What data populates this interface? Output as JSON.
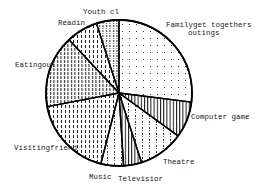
{
  "chart_data": {
    "type": "pie",
    "title": "",
    "start_angle_deg": 0,
    "direction": "clockwise",
    "slices": [
      {
        "label": "Family get togethers & outings",
        "value": 27,
        "pattern": "dots"
      },
      {
        "label": "Computer games",
        "value": 8,
        "pattern": "vlines"
      },
      {
        "label": "Theatre",
        "value": 10,
        "pattern": "dashdots"
      },
      {
        "label": "Television",
        "value": 4,
        "pattern": "vlines"
      },
      {
        "label": "Music",
        "value": 5,
        "pattern": "dashdots"
      },
      {
        "label": "Visiting friends",
        "value": 18,
        "pattern": "dashes"
      },
      {
        "label": "Eating out",
        "value": 16,
        "pattern": "dashes-dense"
      },
      {
        "label": "Reading",
        "value": 7,
        "pattern": "dashes"
      },
      {
        "label": "Youth club",
        "value": 5,
        "pattern": "dashes-dots"
      }
    ],
    "legend": "none (labels placed around pie)"
  },
  "labels": {
    "family_line1": "Familyget togethers",
    "family_line2": "outings",
    "computer": "Computer game",
    "theatre": "Theatre",
    "television": "Televisior",
    "music": "Music",
    "visiting": "Visitingfriend",
    "eating": "Eatingoul",
    "reading": "Readin",
    "youth": "Youth cl"
  }
}
